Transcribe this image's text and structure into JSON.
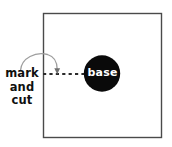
{
  "figure": {
    "type": "instructional-diagram",
    "background_color": "#ffffff"
  },
  "panel": {
    "name": "square-sheet",
    "stroke_color": "#4a4a4a",
    "fill_color": "#ffffff",
    "x": 43,
    "y": 13,
    "width": 119,
    "height": 125
  },
  "base_circle": {
    "label": "base",
    "fill_color": "#0a0a0a",
    "text_color": "#ffffff",
    "center_x": 102,
    "center_y": 73,
    "radius": 18
  },
  "dashed_line": {
    "name": "mark-and-cut-line",
    "color": "#2b2b2b",
    "style": "dashed",
    "from_x": 43,
    "from_y": 74,
    "to_x": 85,
    "to_y": 74
  },
  "callout": {
    "lines": [
      "mark",
      "and",
      "cut"
    ],
    "text_color": "#101010",
    "arrow": {
      "name": "curved-arrow",
      "color": "#9a9a9a",
      "start_x": 20,
      "start_y": 70,
      "end_x": 57,
      "end_y": 73
    }
  }
}
